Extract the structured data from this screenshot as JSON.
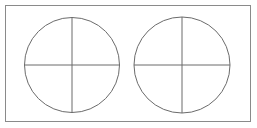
{
  "figure": {
    "canvas": {
      "width": 257,
      "height": 128,
      "background_color": "#ffffff"
    },
    "frame": {
      "label": "outer-rectangle",
      "x": 5.5,
      "y": 5.5,
      "width": 245,
      "height": 116,
      "stroke_color": "#8a8a8a",
      "stroke_width": 1,
      "fill": "none"
    },
    "stroke_color": "#6b6b6b",
    "stroke_width": 1,
    "shapes": [
      {
        "label": "left-circle",
        "center_x": 72,
        "center_y": 65,
        "radius": 47.5,
        "stroke_color": "#6b6b6b",
        "stroke_width": 1,
        "fill": "none",
        "vertical_diameter": {
          "x1": 72,
          "y1": 17.5,
          "x2": 72,
          "y2": 112.5
        },
        "horizontal_diameter": {
          "x1": 24.5,
          "y1": 65,
          "x2": 119.5,
          "y2": 65
        }
      },
      {
        "label": "right-circle",
        "center_x": 182,
        "center_y": 65,
        "radius": 48,
        "stroke_color": "#6b6b6b",
        "stroke_width": 1,
        "fill": "none",
        "vertical_diameter": {
          "x1": 182,
          "y1": 17,
          "x2": 182,
          "y2": 113
        },
        "horizontal_diameter": {
          "x1": 134,
          "y1": 65,
          "x2": 230,
          "y2": 65
        }
      }
    ]
  }
}
